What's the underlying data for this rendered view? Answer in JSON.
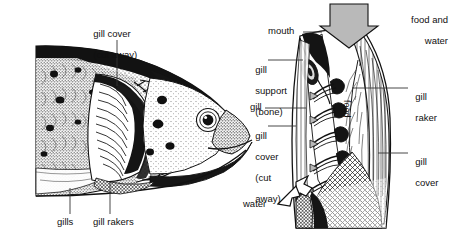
{
  "figure": {
    "background_color": "#ffffff",
    "ink_color": "#111111",
    "arrow_fill": "#b9b9b9",
    "width": 453,
    "height": 243
  },
  "left_panel": {
    "name": "fish-head-illustration",
    "description": "Lateral view of a trout head with gill cover cut away",
    "labels": [
      {
        "id": "gill-cover-cut-away",
        "line1": "gill cover",
        "line2": "(cut away)",
        "x": 88,
        "y": 20,
        "align": "left"
      },
      {
        "id": "gills",
        "text": "gills",
        "x": 62,
        "y": 224,
        "align": "left"
      },
      {
        "id": "gill-rakers",
        "text": "gill rakers",
        "x": 96,
        "y": 224,
        "align": "left"
      }
    ]
  },
  "right_panel": {
    "name": "gill-flow-diagram",
    "description": "Cutaway schematic showing food and water entering the mouth, water exiting past the gills",
    "labels": [
      {
        "id": "food-and-water",
        "line1": "food and",
        "line2": "water",
        "x": 385,
        "y": 6,
        "align": "right"
      },
      {
        "id": "mouth",
        "text": "mouth",
        "x": 274,
        "y": 27,
        "align": "left"
      },
      {
        "id": "gill-support-bone",
        "line1": "gill",
        "line2": "support",
        "line3": "(bone)",
        "x": 252,
        "y": 55,
        "align": "left"
      },
      {
        "id": "gill",
        "text": "gill",
        "x": 252,
        "y": 103,
        "align": "left"
      },
      {
        "id": "gill-cover-cut-away-right",
        "line1": "gill",
        "line2": "cover",
        "line3": "(cut",
        "line4": "away)",
        "x": 252,
        "y": 121,
        "align": "left"
      },
      {
        "id": "food",
        "text": "food",
        "x": 349,
        "y": 101,
        "orientation": "vertical"
      },
      {
        "id": "water",
        "text": "water",
        "x": 243,
        "y": 200,
        "align": "left"
      },
      {
        "id": "gill-raker",
        "line1": "gill",
        "line2": "raker",
        "x": 410,
        "y": 82,
        "align": "left"
      },
      {
        "id": "gill-cover",
        "line1": "gill",
        "line2": "cover",
        "x": 410,
        "y": 147,
        "align": "left"
      }
    ],
    "flow": {
      "intake_label": "food and water",
      "outlet_label": "water",
      "retained_label": "food",
      "gill_arch_count": 5
    }
  }
}
